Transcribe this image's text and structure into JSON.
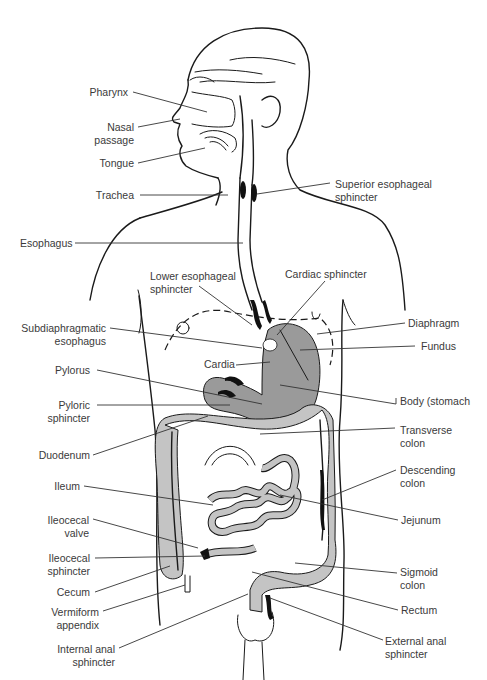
{
  "diagram": {
    "colors": {
      "organ_fill": "#9a9a9a",
      "intestine_light": "#c4c4c4",
      "line": "#1a1a1a",
      "label_text": "#3a3a3a",
      "background": "#ffffff"
    },
    "labels_left": [
      {
        "id": "pharynx",
        "lines": [
          "Pharynx"
        ]
      },
      {
        "id": "nasal-passage",
        "lines": [
          "Nasal",
          "passage"
        ]
      },
      {
        "id": "tongue",
        "lines": [
          "Tongue"
        ]
      },
      {
        "id": "trachea",
        "lines": [
          "Trachea"
        ]
      },
      {
        "id": "esophagus",
        "lines": [
          "Esophagus"
        ]
      },
      {
        "id": "subdiaphragmatic-esophagus",
        "lines": [
          "Subdiaphragmatic",
          "esophagus"
        ]
      },
      {
        "id": "pylorus",
        "lines": [
          "Pylorus"
        ]
      },
      {
        "id": "pyloric-sphincter",
        "lines": [
          "Pyloric",
          "sphincter"
        ]
      },
      {
        "id": "duodenum",
        "lines": [
          "Duodenum"
        ]
      },
      {
        "id": "ileum",
        "lines": [
          "Ileum"
        ]
      },
      {
        "id": "ileocecal-valve",
        "lines": [
          "Ileocecal",
          "valve"
        ]
      },
      {
        "id": "ileocecal-sphincter",
        "lines": [
          "Ileocecal",
          "sphincter"
        ]
      },
      {
        "id": "cecum",
        "lines": [
          "Cecum"
        ]
      },
      {
        "id": "vermiform-appendix",
        "lines": [
          "Vermiform",
          "appendix"
        ]
      },
      {
        "id": "internal-anal-sphincter",
        "lines": [
          "Internal anal",
          "sphincter"
        ]
      }
    ],
    "labels_center": [
      {
        "id": "lower-esophageal-sphincter",
        "lines": [
          "Lower esophageal",
          "sphincter"
        ]
      },
      {
        "id": "cardiac-sphincter",
        "lines": [
          "Cardiac sphincter"
        ]
      },
      {
        "id": "cardia",
        "lines": [
          "Cardia"
        ]
      }
    ],
    "labels_right": [
      {
        "id": "superior-esophageal-sphincter",
        "lines": [
          "Superior esophageal",
          "sphincter"
        ]
      },
      {
        "id": "diaphragm",
        "lines": [
          "Diaphragm"
        ]
      },
      {
        "id": "fundus",
        "lines": [
          "Fundus"
        ]
      },
      {
        "id": "body-stomach",
        "lines": [
          "Body (stomach"
        ]
      },
      {
        "id": "transverse-colon",
        "lines": [
          "Transverse",
          "colon"
        ]
      },
      {
        "id": "descending-colon",
        "lines": [
          "Descending",
          "colon"
        ]
      },
      {
        "id": "jejunum",
        "lines": [
          "Jejunum"
        ]
      },
      {
        "id": "sigmoid-colon",
        "lines": [
          "Sigmoid",
          "colon"
        ]
      },
      {
        "id": "rectum",
        "lines": [
          "Rectum"
        ]
      },
      {
        "id": "external-anal-sphincter",
        "lines": [
          "External anal",
          "sphincter"
        ]
      }
    ]
  }
}
